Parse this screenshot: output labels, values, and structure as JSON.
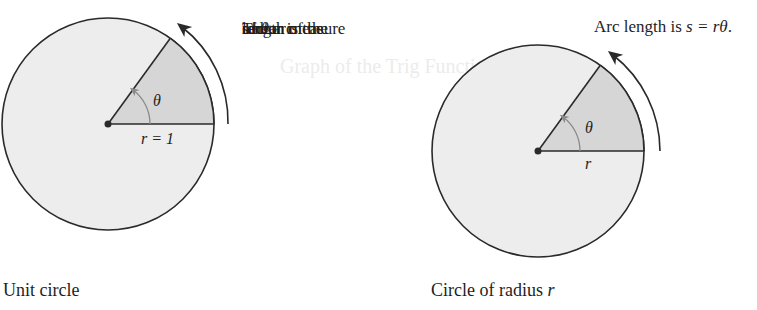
{
  "figure": {
    "colors": {
      "circle_fill": "#ededed",
      "sector_fill": "#d6d6d6",
      "stroke": "#2a2a2a",
      "angle_arrow": "#8a8a8a"
    },
    "left": {
      "caption": "Unit circle",
      "radius_label": "r = 1",
      "angle_label": "θ",
      "annotation_lines": [
        "The arc",
        "length of the",
        "sector is the",
        "radian measure",
        "of "
      ],
      "annotation_theta": "θ",
      "annotation_end": "."
    },
    "right": {
      "caption_prefix": "Circle of radius ",
      "caption_var": "r",
      "radius_label": "r",
      "angle_label": "θ",
      "annotation_prefix": "Arc length is ",
      "annotation_formula": "s = rθ",
      "annotation_end": "."
    }
  }
}
